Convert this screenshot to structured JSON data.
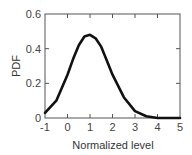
{
  "chart_data": {
    "type": "line",
    "title": "",
    "xlabel": "Normalized level",
    "ylabel": "PDF",
    "xlim": [
      -1,
      5
    ],
    "ylim": [
      0,
      0.6
    ],
    "xticks": [
      "-1",
      "0",
      "1",
      "2",
      "3",
      "4",
      "5"
    ],
    "yticks": [
      "0",
      "0.2",
      "0.4",
      "0.6"
    ],
    "grid": false,
    "legend": null,
    "series": [
      {
        "name": "PDF",
        "x": [
          -1,
          -0.5,
          0,
          0.25,
          0.5,
          0.75,
          1,
          1.25,
          1.5,
          1.75,
          2,
          2.5,
          3,
          3.5,
          4,
          4.5,
          5
        ],
        "values": [
          0.03,
          0.1,
          0.25,
          0.34,
          0.42,
          0.47,
          0.48,
          0.46,
          0.41,
          0.33,
          0.25,
          0.12,
          0.04,
          0.01,
          0.0,
          0.0,
          0.0
        ]
      }
    ]
  }
}
